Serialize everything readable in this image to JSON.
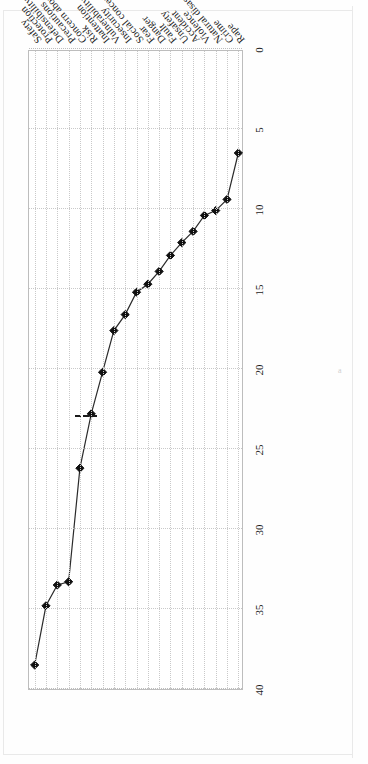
{
  "figure": {
    "orientation": "rotated-90-ccw-scan",
    "marginal_text": "a",
    "refline_label": ""
  },
  "chart_data": {
    "type": "line",
    "title": "",
    "subtitle": "",
    "xlabel": "",
    "ylabel": "",
    "grid": true,
    "legend_position": "none",
    "xlim": [
      0,
      40
    ],
    "xticks": [
      0,
      5,
      10,
      15,
      20,
      25,
      30,
      35,
      40
    ],
    "xtick_labels": [
      "0",
      "5",
      "10",
      "15",
      "20",
      "25",
      "30",
      "35",
      "40"
    ],
    "marker": "diamond",
    "marker_color": "#101010",
    "line_color": "#2b2b2b",
    "grid_color": "#c9c9c9",
    "annotations": [
      {
        "type": "reference-line",
        "style": "dashed",
        "orientation": "vertical",
        "value": 23,
        "color": "#1a1a1a"
      }
    ],
    "categories": [
      "Safety",
      "Protection",
      "Defensibility",
      "Precautions",
      "Concern about others",
      "Risk",
      "Inattention",
      "Vulnerability",
      "Insecurity",
      "Social concern",
      "Fear",
      "Danger",
      "Fault",
      "Unsafety",
      "Accident",
      "Violence",
      "Natural disaster",
      "Crime",
      "Rape"
    ],
    "values": [
      38.5,
      34.8,
      33.5,
      33.3,
      26.2,
      22.8,
      20.2,
      17.6,
      16.6,
      15.2,
      14.7,
      13.9,
      12.9,
      12.1,
      11.4,
      10.4,
      10.1,
      9.4,
      6.5
    ]
  }
}
